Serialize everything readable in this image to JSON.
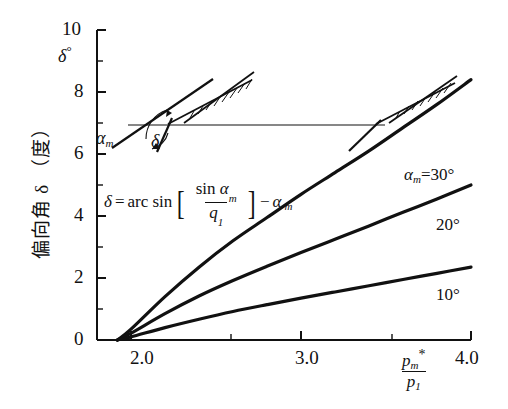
{
  "chart_data": {
    "type": "line",
    "title": "",
    "xlabel": "p_m*/p_1",
    "ylabel": "偏向角 δ （度）",
    "ylabel_secondary": "δ°",
    "xlim": [
      1.8,
      4.0
    ],
    "ylim": [
      0,
      10
    ],
    "grid": false,
    "legend_position": "inline-right",
    "x_ticks": [
      "2.0",
      "3.0",
      "4.0"
    ],
    "x_tick_values": [
      2.0,
      3.0,
      4.0
    ],
    "y_ticks": [
      "0",
      "2",
      "4",
      "6",
      "8",
      "10"
    ],
    "y_tick_values": [
      0,
      2,
      4,
      6,
      8,
      10
    ],
    "y_minor_ticks": [
      1,
      3,
      5,
      7,
      9
    ],
    "annotation_formula": "δ=arc sin [ sin α_m / q_1 ] − α_m",
    "series": [
      {
        "name": "α_m=30°",
        "label": "α_m=30°",
        "x": [
          1.92,
          2.0,
          2.2,
          2.4,
          2.6,
          2.8,
          3.0,
          3.2,
          3.4,
          3.6,
          3.8,
          4.0
        ],
        "values": [
          0.0,
          0.35,
          1.4,
          2.35,
          3.2,
          3.95,
          4.7,
          5.4,
          6.1,
          6.85,
          7.6,
          8.4
        ]
      },
      {
        "name": "20°",
        "label": "20°",
        "x": [
          1.92,
          2.0,
          2.2,
          2.4,
          2.6,
          2.8,
          3.0,
          3.2,
          3.4,
          3.6,
          3.8,
          4.0
        ],
        "values": [
          0.0,
          0.22,
          0.85,
          1.42,
          1.92,
          2.38,
          2.82,
          3.25,
          3.68,
          4.12,
          4.55,
          5.0
        ]
      },
      {
        "name": "10°",
        "label": "10°",
        "x": [
          1.92,
          2.0,
          2.2,
          2.4,
          2.6,
          2.8,
          3.0,
          3.2,
          3.4,
          3.6,
          3.8,
          4.0
        ],
        "values": [
          0.0,
          0.1,
          0.4,
          0.67,
          0.92,
          1.14,
          1.35,
          1.55,
          1.75,
          1.95,
          2.15,
          2.35
        ]
      }
    ]
  },
  "axes": {
    "y_title_vertical": "偏向角 δ （度）",
    "y_unit_symbol": "δ",
    "y_unit_degree": "°",
    "y_tick_10": "10",
    "y_tick_8": "8",
    "y_tick_6": "6",
    "y_tick_4": "4",
    "y_tick_2": "2",
    "y_tick_0": "0",
    "x_tick_20": "2.0",
    "x_tick_30": "3.0",
    "x_tick_40": "4.0",
    "x_label_numerator": "p",
    "x_label_numerator_sub": "m",
    "x_label_numerator_star": "*",
    "x_label_denominator": "p",
    "x_label_denominator_sub": "1"
  },
  "formula": {
    "lhs": "δ",
    "equals": "=",
    "arcsin": "arc sin",
    "bracket_open": "[",
    "bracket_close": "]",
    "num_sin": "sin",
    "num_alpha": "α",
    "num_alpha_sub": "m",
    "den_q": "q",
    "den_q_sub": "1",
    "minus": "−",
    "tail_alpha": "α",
    "tail_alpha_sub": "m"
  },
  "curve_labels": {
    "c30_alpha": "α",
    "c30_alpha_sub": "m",
    "c30_eq": "=30°",
    "c20": "20°",
    "c10": "10°"
  },
  "inset": {
    "alpha_symbol": "α",
    "alpha_sub": "m",
    "delta_symbol": "δ",
    "name": "oblique-shock-deflection-diagram"
  }
}
